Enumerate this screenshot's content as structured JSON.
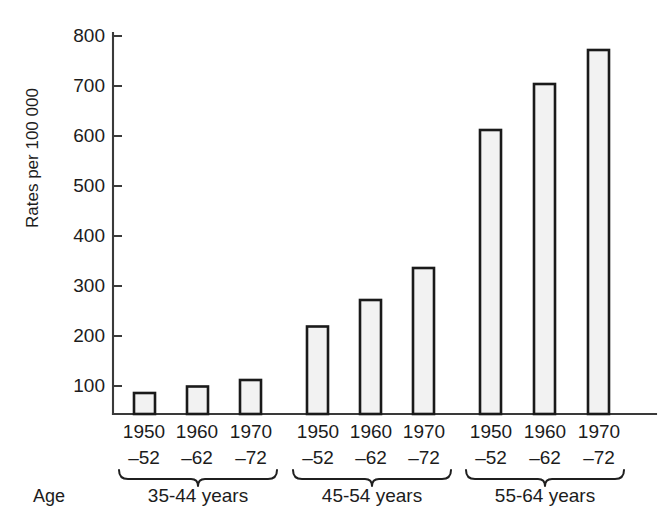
{
  "chart_data": {
    "type": "bar",
    "title": "",
    "subtitle": "",
    "xlabel": "Age",
    "ylabel": "Rates per 100 000",
    "ylim": [
      0,
      800
    ],
    "ytick_step": 100,
    "yticks": [
      100,
      200,
      300,
      400,
      500,
      600,
      700,
      800
    ],
    "ytick_labels": [
      "100",
      "200",
      "300",
      "400",
      "500",
      "600",
      "700",
      "800"
    ],
    "grid": false,
    "legend": "none",
    "categories": [
      "1950–52",
      "1960–62",
      "1970–72"
    ],
    "category_label_lines": [
      [
        "1950",
        "–52"
      ],
      [
        "1960",
        "–62"
      ],
      [
        "1970",
        "–72"
      ]
    ],
    "groups": [
      {
        "name": "35-44 years",
        "values": [
          42,
          55,
          68
        ]
      },
      {
        "name": "45-54 years",
        "values": [
          175,
          228,
          292
        ]
      },
      {
        "name": "55-64 years",
        "values": [
          568,
          660,
          728
        ]
      }
    ],
    "series": [
      {
        "name": "1950–52",
        "values": [
          42,
          175,
          568
        ]
      },
      {
        "name": "1960–62",
        "values": [
          55,
          228,
          660
        ]
      },
      {
        "name": "1970–72",
        "values": [
          68,
          292,
          728
        ]
      }
    ],
    "annotations": [
      "Braces group the three year-period bars under each age band"
    ],
    "colors": {
      "bar_fill": "#f2f2f2",
      "bar_stroke": "#1a1a1a",
      "axis": "#3a3a3a",
      "text": "#1c1c1c",
      "background": "#ffffff"
    }
  },
  "axis": {
    "y_label": "Rates per 100 000",
    "x_label": "Age"
  },
  "group_labels": [
    "35-44 years",
    "45-54 years",
    "55-64 years"
  ]
}
